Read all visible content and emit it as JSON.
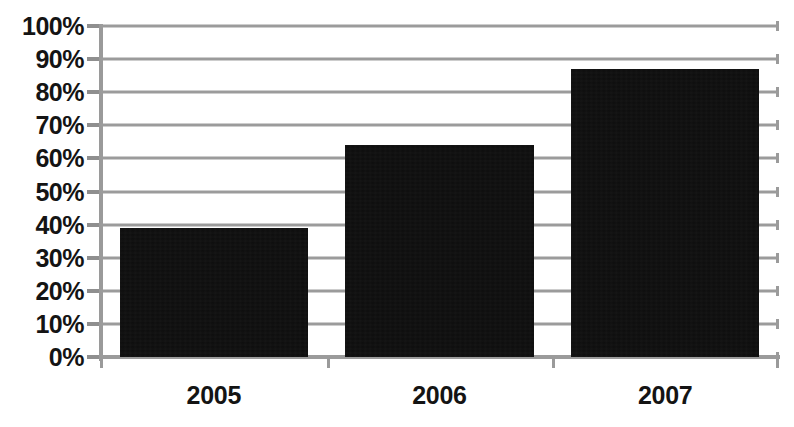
{
  "chart_data": {
    "type": "bar",
    "title": "",
    "subtitle": "",
    "xlabel": "",
    "ylabel": "",
    "categories": [
      "2005",
      "2006",
      "2007"
    ],
    "values": [
      39,
      64,
      87
    ],
    "value_suffix": "%",
    "ylim": [
      0,
      100
    ],
    "y_ticks": [
      0,
      10,
      20,
      30,
      40,
      50,
      60,
      70,
      80,
      90,
      100
    ],
    "y_tick_labels": [
      "0%",
      "10%",
      "20%",
      "30%",
      "40%",
      "50%",
      "60%",
      "70%",
      "80%",
      "90%",
      "100%"
    ],
    "series": [
      {
        "name": "",
        "values": [
          39,
          64,
          87
        ],
        "color": "#0d0d0d"
      }
    ],
    "grid": {
      "horizontal": true,
      "vertical": false,
      "color": "#9b9b9b"
    },
    "legend": {
      "visible": false,
      "position": "none",
      "entries": []
    },
    "axis_color": "#9a9a9a",
    "label_color": "#141414",
    "background_color": "#ffffff",
    "data_labels_visible": false,
    "annotations": []
  }
}
